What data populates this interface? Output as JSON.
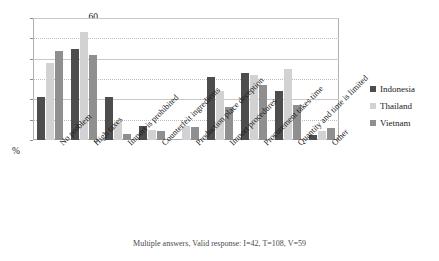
{
  "chart_data": {
    "type": "bar",
    "title": "",
    "subtitle": "",
    "xlabel": "",
    "ylabel": "%",
    "ylim": [
      0,
      60
    ],
    "yticks": [
      0,
      10,
      20,
      30,
      40,
      50,
      60
    ],
    "grid": true,
    "legend_position": "right",
    "categories": [
      "No problem",
      "High taxes",
      "Import is prohibited",
      "Counterfeit ingredients",
      "Production place deception",
      "Import procedures",
      "Procurement takes time",
      "Quantity and time is limited",
      "Other"
    ],
    "series": [
      {
        "name": "Indonesia",
        "color": "#4d4d4d",
        "values": [
          21,
          45,
          21,
          7,
          0,
          31,
          33,
          24,
          2.5
        ]
      },
      {
        "name": "Thailand",
        "color": "#d2d2d2",
        "values": [
          38,
          53,
          9,
          5,
          7,
          24,
          32,
          35,
          4.5
        ]
      },
      {
        "name": "Vietnam",
        "color": "#8f8f8f",
        "values": [
          44,
          42,
          3,
          4.5,
          6.5,
          16,
          27,
          17,
          6
        ]
      }
    ]
  },
  "axis": {
    "unit_label": "%"
  },
  "caption": {
    "text": "Multiple answers, Valid response: I=42, T=108, V=59"
  }
}
